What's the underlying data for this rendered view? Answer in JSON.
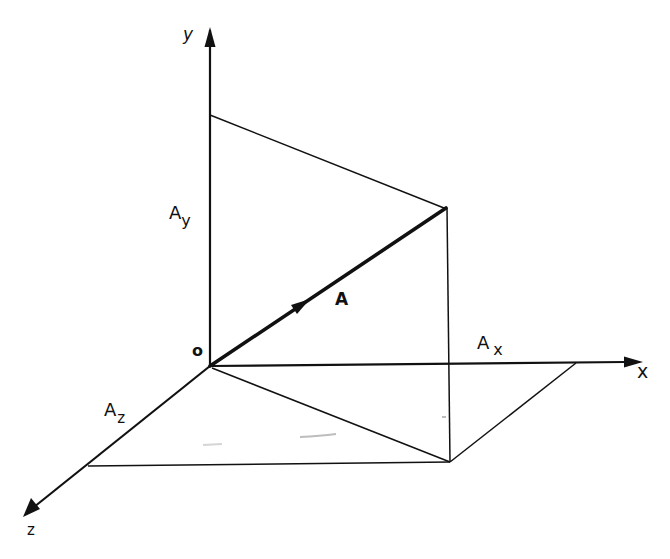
{
  "figure": {
    "colors": {
      "background": "#ffffff",
      "ink": "#111111",
      "bleed_through": "#e6e6e6"
    },
    "origin_label": "o",
    "axes": {
      "x": {
        "label": "x"
      },
      "y": {
        "label": "y"
      },
      "z": {
        "label": "z"
      }
    },
    "vector": {
      "label": "A"
    },
    "components": {
      "ax": {
        "main": "A",
        "sub": "x"
      },
      "ay": {
        "main": "A",
        "sub": "y"
      },
      "az": {
        "main": "A",
        "sub": "z"
      }
    }
  }
}
